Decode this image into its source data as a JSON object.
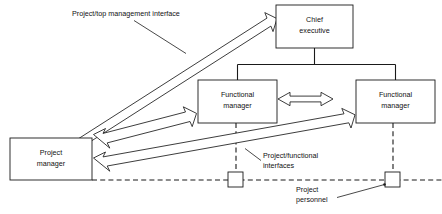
{
  "diagram": {
    "nodes": [
      {
        "id": "chief-executive",
        "line1": "Chief",
        "line2": "executive",
        "x": 276,
        "y": 5,
        "w": 77,
        "h": 43
      },
      {
        "id": "functional-manager-left",
        "line1": "Functional",
        "line2": "manager",
        "x": 198,
        "y": 80,
        "w": 79,
        "h": 43
      },
      {
        "id": "functional-manager-right",
        "line1": "Functional",
        "line2": "manager",
        "x": 356,
        "y": 80,
        "w": 79,
        "h": 43
      },
      {
        "id": "project-manager",
        "line1": "Project",
        "line2": "manager",
        "x": 10,
        "y": 138,
        "w": 82,
        "h": 42
      }
    ],
    "personnel_nodes": [
      {
        "id": "project-personnel-left",
        "x": 228,
        "y": 172,
        "size": 15
      },
      {
        "id": "project-personnel-right",
        "x": 385,
        "y": 172,
        "size": 15
      }
    ],
    "annotations": [
      {
        "id": "project-top-management-interface",
        "text_lines": [
          "Project/top management interface"
        ],
        "x": 72,
        "y": 16
      },
      {
        "id": "project-functional-interfaces",
        "text_lines": [
          "Project/functional",
          "interfaces"
        ],
        "x": 263,
        "y": 158
      },
      {
        "id": "project-personnel",
        "text_lines": [
          "Project",
          "personnel"
        ],
        "x": 296,
        "y": 192
      }
    ],
    "colors": {
      "stroke": "#1a1a1a",
      "fill": "#ffffff",
      "text": "#111111",
      "background": "#ffffff"
    },
    "arrows": [
      {
        "id": "pm-to-chief-executive",
        "kind": "double-block-arrow",
        "from": "project-manager",
        "to": "chief-executive"
      },
      {
        "id": "pm-to-functional-manager-left",
        "kind": "double-block-arrow",
        "from": "project-manager",
        "to": "functional-manager-left"
      },
      {
        "id": "pm-to-functional-manager-right",
        "kind": "double-block-arrow",
        "from": "project-manager",
        "to": "functional-manager-right"
      },
      {
        "id": "functional-manager-left-to-right",
        "kind": "double-block-arrow",
        "from": "functional-manager-left",
        "to": "functional-manager-right"
      }
    ]
  }
}
